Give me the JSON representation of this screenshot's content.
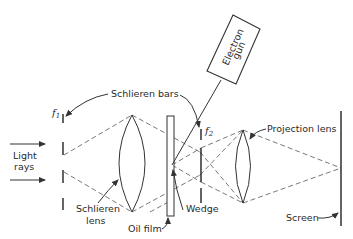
{
  "diagram": {
    "labels": {
      "electron_gun_line1": "Electron",
      "electron_gun_line2": "gun",
      "schlieren_bars": "Schlieren bars",
      "f1": "f",
      "f1_sub": "1",
      "f2": "f",
      "f2_sub": "2",
      "projection_lens": "Projection lens",
      "light_rays_line1": "Light",
      "light_rays_line2": "rays",
      "schlieren_lens_line1": "Schlieren",
      "schlieren_lens_line2": "lens",
      "oil_film": "Oil film",
      "wedge": "Wedge",
      "screen": "Screen"
    },
    "components": [
      {
        "name": "light-rays",
        "type": "arrows"
      },
      {
        "name": "schlieren-bars-f1",
        "type": "bars",
        "x": 63
      },
      {
        "name": "schlieren-lens",
        "type": "lens",
        "x": 132
      },
      {
        "name": "oil-film",
        "type": "plate",
        "x": 171
      },
      {
        "name": "schlieren-bars-f2",
        "type": "bars",
        "x": 201
      },
      {
        "name": "electron-gun",
        "type": "box"
      },
      {
        "name": "projection-lens",
        "type": "lens",
        "x": 244
      },
      {
        "name": "screen",
        "type": "line",
        "x": 341
      }
    ]
  }
}
